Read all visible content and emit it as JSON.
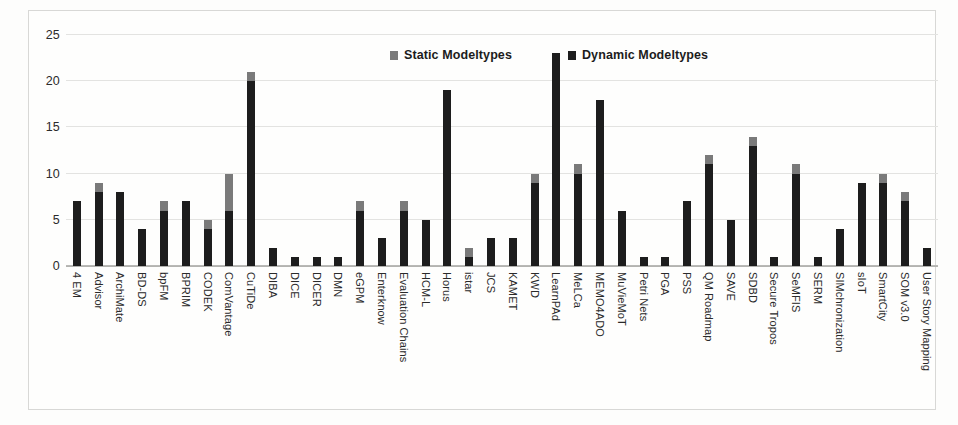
{
  "chart_data": {
    "type": "bar",
    "subtype": "stacked-vertical",
    "title": "",
    "xlabel": "",
    "ylabel": "",
    "ylim": [
      0,
      25
    ],
    "ytick_values": [
      0,
      5,
      10,
      15,
      20,
      25
    ],
    "ytick_labels": [
      "0",
      "5",
      "10",
      "15",
      "20",
      "25"
    ],
    "grid": true,
    "grid_axis": "y",
    "legend_position": "top-center",
    "categories": [
      "4 EM",
      "Advisor",
      "ArchiMate",
      "BD-DS",
      "bpFM",
      "BPRIM",
      "CODEK",
      "ComVantage",
      "CuTiDe",
      "DIBA",
      "DICE",
      "DICER",
      "DMN",
      "eGPM",
      "Enterknow",
      "Evaluation Chains",
      "HCM-L",
      "Horus",
      "istar",
      "JCS",
      "KAMET",
      "KWD",
      "LearnPAd",
      "MeLCa",
      "MEMO4ADO",
      "MuVieMoT",
      "Petri Nets",
      "PGA",
      "PSS",
      "QM Roadmap",
      "SAVE",
      "SDBD",
      "Secure Tropos",
      "SeMFIS",
      "SERM",
      "SIMchronization",
      "sIoT",
      "SmartCity",
      "SOM v3.0",
      "User Story Mapping"
    ],
    "series": [
      {
        "name": "Dynamic Modeltypes",
        "color": "#1d1d1d",
        "values": [
          7,
          8,
          8,
          4,
          6,
          7,
          4,
          6,
          20,
          2,
          1,
          1,
          1,
          6,
          3,
          6,
          5,
          19,
          1,
          3,
          3,
          9,
          23,
          10,
          18,
          6,
          1,
          1,
          7,
          11,
          5,
          13,
          1,
          10,
          1,
          4,
          9,
          9,
          7,
          2
        ]
      },
      {
        "name": "Static Modeltypes",
        "color": "#7a7a7a",
        "values": [
          0,
          1,
          0,
          0,
          1,
          0,
          1,
          4,
          1,
          0,
          0,
          0,
          0,
          1,
          0,
          1,
          0,
          0,
          1,
          0,
          0,
          1,
          0,
          1,
          0,
          0,
          0,
          0,
          0,
          1,
          0,
          1,
          0,
          1,
          0,
          0,
          0,
          1,
          1,
          0
        ]
      }
    ],
    "totals": [
      7,
      9,
      8,
      4,
      7,
      7,
      5,
      10,
      21,
      2,
      1,
      1,
      1,
      7,
      3,
      7,
      5,
      19,
      2,
      3,
      3,
      10,
      23,
      11,
      18,
      6,
      1,
      1,
      7,
      12,
      5,
      14,
      1,
      11,
      1,
      4,
      9,
      10,
      8,
      2
    ]
  },
  "legend": {
    "entries": [
      {
        "label": "Static Modeltypes",
        "swatch": "static-swatch-icon",
        "color": "#7a7a7a"
      },
      {
        "label": "Dynamic Modeltypes",
        "swatch": "dynamic-swatch-icon",
        "color": "#1d1d1d"
      }
    ]
  },
  "colors": {
    "static": "#7a7a7a",
    "dynamic": "#1d1d1d",
    "grid": "#e3e3e1",
    "axis": "#b3b3b0",
    "background": "#fefefd",
    "text": "#2a2a2a"
  }
}
